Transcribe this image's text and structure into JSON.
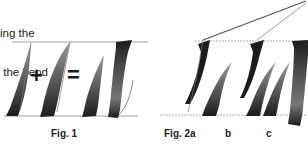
{
  "caption": {
    "line1": "ing the",
    "line2": " the bend"
  },
  "figures": {
    "fig1": {
      "label": "Fig. 1",
      "operators": [
        "+",
        "="
      ]
    },
    "fig2a": {
      "label": "Fig. 2a"
    },
    "fig2b": {
      "label": "b"
    },
    "fig2c": {
      "label": "c"
    }
  },
  "colors": {
    "stroke_dark": "#1c1c1c",
    "stroke_mid": "#5a5a5a",
    "stroke_light": "#8a8a8a",
    "guide_line": "#9a9a9a",
    "background": "#ffffff"
  }
}
